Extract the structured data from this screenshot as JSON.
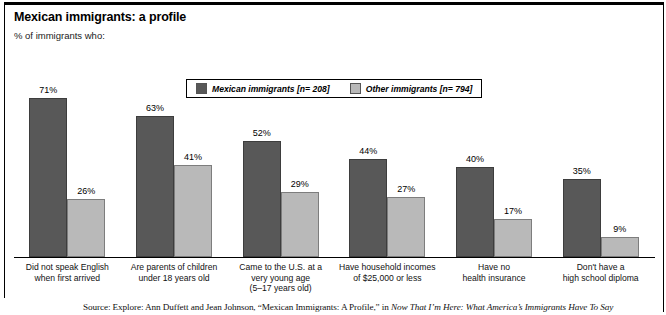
{
  "chart_data": {
    "type": "bar",
    "title": "Mexican immigrants: a profile",
    "subtitle": "% of immigrants who:",
    "xlabel": "",
    "ylabel": "",
    "ylim": [
      0,
      80
    ],
    "grid": false,
    "legend_position": "top-center",
    "value_suffix": "%",
    "categories": [
      "Did not speak English\nwhen first arrived",
      "Are parents of children\nunder 18 years old",
      "Came to the U.S. at a\nvery young age\n(5–17 years old)",
      "Have household incomes\nof $25,000 or less",
      "Have no\nhealth insurance",
      "Don't have a\nhigh school diploma"
    ],
    "category_lines": [
      [
        "Did not speak English",
        "when first arrived"
      ],
      [
        "Are parents of children",
        "under 18 years old"
      ],
      [
        "Came to the U.S. at a",
        "very young age",
        "(5–17 years old)"
      ],
      [
        "Have household incomes",
        "of $25,000 or less"
      ],
      [
        "Have no",
        "health insurance"
      ],
      [
        "Don't have a",
        "high school diploma"
      ]
    ],
    "series": [
      {
        "name": "Mexican immigrants [n= 208]",
        "color": "#585858",
        "values": [
          71,
          63,
          52,
          44,
          40,
          35
        ],
        "labels": [
          "71%",
          "63%",
          "52%",
          "44%",
          "40%",
          "35%"
        ]
      },
      {
        "name": "Other immigrants [n= 794]",
        "color": "#b9b9b9",
        "values": [
          26,
          41,
          29,
          27,
          17,
          9
        ],
        "labels": [
          "26%",
          "41%",
          "29%",
          "27%",
          "17%",
          "9%"
        ]
      }
    ]
  },
  "legend": {
    "items": [
      {
        "label": "Mexican immigrants [n= 208]",
        "color": "#585858"
      },
      {
        "label": "Other immigrants [n= 794]",
        "color": "#b9b9b9"
      }
    ]
  },
  "source": {
    "prefix": "Source: Explore: Ann Duffett and Jean Johnson, “Mexican Immigrants: A Profile,” in ",
    "italic_title": "Now That I’m Here: What America’s Immigrants Have To Say"
  }
}
